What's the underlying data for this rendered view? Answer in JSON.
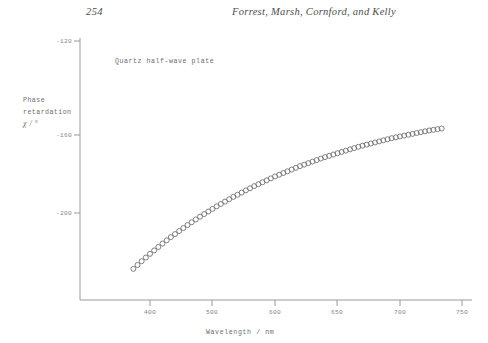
{
  "page": {
    "number": "254",
    "running_head": "Forrest, Marsh, Cornford, and Kelly"
  },
  "figure": {
    "annotation": "Quartz half-wave plate",
    "axis_color": "#8a8a8a",
    "marker_color": "#6b6b6b",
    "y_title_line1": "Phase",
    "y_title_line2": "retardation",
    "y_title_symbol": "χ / °",
    "x_title": "Wavelength / nm"
  },
  "chart_data": {
    "type": "scatter",
    "title": "Quartz half-wave plate",
    "xlabel": "Wavelength / nm",
    "ylabel": "Phase retardation χ / °",
    "xlim": [
      360,
      760
    ],
    "ylim": [
      -230,
      -115
    ],
    "xticks": [
      400,
      500,
      600,
      650,
      700,
      750
    ],
    "xtick_labels": [
      "400",
      "500",
      "600",
      "650",
      "700",
      "750"
    ],
    "yticks": [
      -120,
      -160,
      -200
    ],
    "ytick_labels": [
      "-120",
      "-160",
      "-200"
    ],
    "grid": false,
    "legend": false,
    "marker": "open-circle",
    "series": [
      {
        "name": "Quartz half-wave plate",
        "x": [
          380,
          385,
          390,
          395,
          400,
          405,
          410,
          415,
          420,
          425,
          430,
          435,
          440,
          445,
          450,
          455,
          460,
          465,
          470,
          475,
          480,
          485,
          490,
          495,
          500,
          505,
          510,
          515,
          520,
          525,
          530,
          535,
          540,
          545,
          550,
          555,
          560,
          565,
          570,
          575,
          580,
          585,
          590,
          595,
          600,
          605,
          610,
          615,
          620,
          625,
          630,
          635,
          640,
          645,
          650,
          655,
          660,
          665,
          670,
          675,
          680,
          685,
          690,
          695,
          700,
          705,
          710,
          715,
          720,
          725,
          730,
          735,
          740,
          745,
          750
        ],
        "y": [
          -226.0,
          -224.2,
          -222.4,
          -220.7,
          -219.0,
          -217.4,
          -215.8,
          -214.2,
          -212.7,
          -211.2,
          -209.8,
          -208.4,
          -207.0,
          -205.6,
          -204.3,
          -203.0,
          -201.7,
          -200.5,
          -199.3,
          -198.1,
          -196.9,
          -195.8,
          -194.7,
          -193.6,
          -192.5,
          -191.5,
          -190.5,
          -189.5,
          -188.5,
          -187.5,
          -186.6,
          -185.7,
          -184.8,
          -183.9,
          -183.0,
          -182.2,
          -181.4,
          -180.6,
          -179.8,
          -179.0,
          -178.2,
          -177.5,
          -176.8,
          -176.1,
          -175.4,
          -174.7,
          -174.0,
          -173.4,
          -172.8,
          -172.2,
          -171.6,
          -171.0,
          -170.4,
          -169.8,
          -169.2,
          -168.7,
          -168.2,
          -167.7,
          -167.2,
          -166.7,
          -166.2,
          -165.7,
          -165.2,
          -164.8,
          -164.4,
          -164.0,
          -163.6,
          -163.2,
          -162.8,
          -162.4,
          -162.0,
          -161.6,
          -161.3,
          -161.0,
          -160.7
        ]
      }
    ]
  }
}
